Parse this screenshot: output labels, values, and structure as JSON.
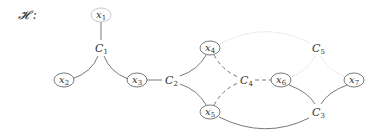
{
  "title": "𝓗 :",
  "colors": {
    "solid_edge": "#555555",
    "dashed_edge": "#555555",
    "dotted_edge": "#c8c8c8",
    "node_border_dark": "#555555",
    "node_border_light": "#bbbbbb",
    "text": "#333333"
  },
  "variables": [
    {
      "id": "x1",
      "base": "x",
      "sub": "1",
      "x": 101,
      "y": 15,
      "border": "light"
    },
    {
      "id": "x2",
      "base": "x",
      "sub": "2",
      "x": 64,
      "y": 80,
      "border": "dark"
    },
    {
      "id": "x3",
      "base": "x",
      "sub": "3",
      "x": 137,
      "y": 80,
      "border": "dark"
    },
    {
      "id": "x4",
      "base": "x",
      "sub": "4",
      "x": 210,
      "y": 48,
      "border": "dark"
    },
    {
      "id": "x5",
      "base": "x",
      "sub": "5",
      "x": 210,
      "y": 112,
      "border": "dark"
    },
    {
      "id": "x6",
      "base": "x",
      "sub": "6",
      "x": 281,
      "y": 80,
      "border": "dark"
    },
    {
      "id": "x7",
      "base": "x",
      "sub": "7",
      "x": 354,
      "y": 80,
      "border": "dark"
    }
  ],
  "constraints": [
    {
      "id": "C1",
      "base": "C",
      "sub": "1",
      "x": 101,
      "y": 48
    },
    {
      "id": "C2",
      "base": "C",
      "sub": "2",
      "x": 171,
      "y": 80
    },
    {
      "id": "C3",
      "base": "C",
      "sub": "3",
      "x": 318,
      "y": 112
    },
    {
      "id": "C4",
      "base": "C",
      "sub": "4",
      "x": 246,
      "y": 80
    },
    {
      "id": "C5",
      "base": "C",
      "sub": "5",
      "x": 318,
      "y": 48
    }
  ],
  "edges": [
    {
      "from": "x1",
      "to": "C1",
      "style": "solid"
    },
    {
      "from": "C1",
      "to": "x2",
      "style": "solid"
    },
    {
      "from": "C1",
      "to": "x3",
      "style": "solid"
    },
    {
      "from": "x3",
      "to": "C2",
      "style": "solid"
    },
    {
      "from": "C2",
      "to": "x4",
      "style": "solid"
    },
    {
      "from": "C2",
      "to": "x5",
      "style": "solid"
    },
    {
      "from": "x4",
      "to": "C4",
      "style": "dashed"
    },
    {
      "from": "x5",
      "to": "C4",
      "style": "dashed"
    },
    {
      "from": "C4",
      "to": "x6",
      "style": "dashed"
    },
    {
      "from": "x4",
      "to": "C5",
      "style": "dotted"
    },
    {
      "from": "C5",
      "to": "x6",
      "style": "dotted"
    },
    {
      "from": "C5",
      "to": "x7",
      "style": "dotted"
    },
    {
      "from": "x6",
      "to": "C3",
      "style": "solid"
    },
    {
      "from": "x7",
      "to": "C3",
      "style": "solid"
    },
    {
      "from": "x5",
      "to": "C3",
      "style": "solid"
    }
  ]
}
